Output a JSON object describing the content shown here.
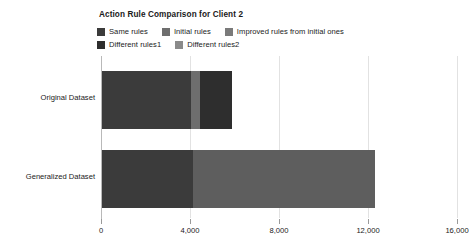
{
  "chart_data": {
    "type": "bar",
    "orientation": "horizontal",
    "stacked": true,
    "title": "Action Rule Comparison for Client 2",
    "xlabel": "",
    "ylabel": "",
    "xlim": [
      0,
      16000
    ],
    "xticks": [
      0,
      4000,
      8000,
      12000,
      16000
    ],
    "xticklabels": [
      "0",
      "4,000",
      "8,000",
      "12,000",
      "16,000"
    ],
    "grid": true,
    "legend_position": "top-left",
    "categories": [
      "Original Dataset",
      "Generalized Dataset"
    ],
    "series": [
      {
        "name": "Same rules",
        "color": "#3b3b3b",
        "values": [
          4050,
          4150
        ]
      },
      {
        "name": "Initial rules",
        "color": "#6e6e6e",
        "values": [
          400,
          0
        ]
      },
      {
        "name": "Improved rules from initial ones",
        "color": "#7a7a7a",
        "values": [
          0,
          0
        ]
      },
      {
        "name": "Different rules1",
        "color": "#2e2e2e",
        "values": [
          1440,
          0
        ]
      },
      {
        "name": "Different rules2",
        "color": "#5e5e5e",
        "values": [
          0,
          8150
        ]
      }
    ],
    "totals": [
      5890,
      12300
    ]
  },
  "legend": {
    "rows": [
      [
        {
          "label": "Same rules",
          "color": "#3b3b3b"
        },
        {
          "label": "Initial rules",
          "color": "#6e6e6e"
        },
        {
          "label": "Improved rules from initial ones",
          "color": "#7a7a7a"
        }
      ],
      [
        {
          "label": "Different rules1",
          "color": "#2e2e2e"
        },
        {
          "label": "Different rules2",
          "color": "#8a8a8a"
        }
      ]
    ]
  },
  "colors": {
    "gridline": "#e2e2e2",
    "axis": "#b9b9b9",
    "text": "#1a1a1a",
    "background": "#ffffff"
  }
}
